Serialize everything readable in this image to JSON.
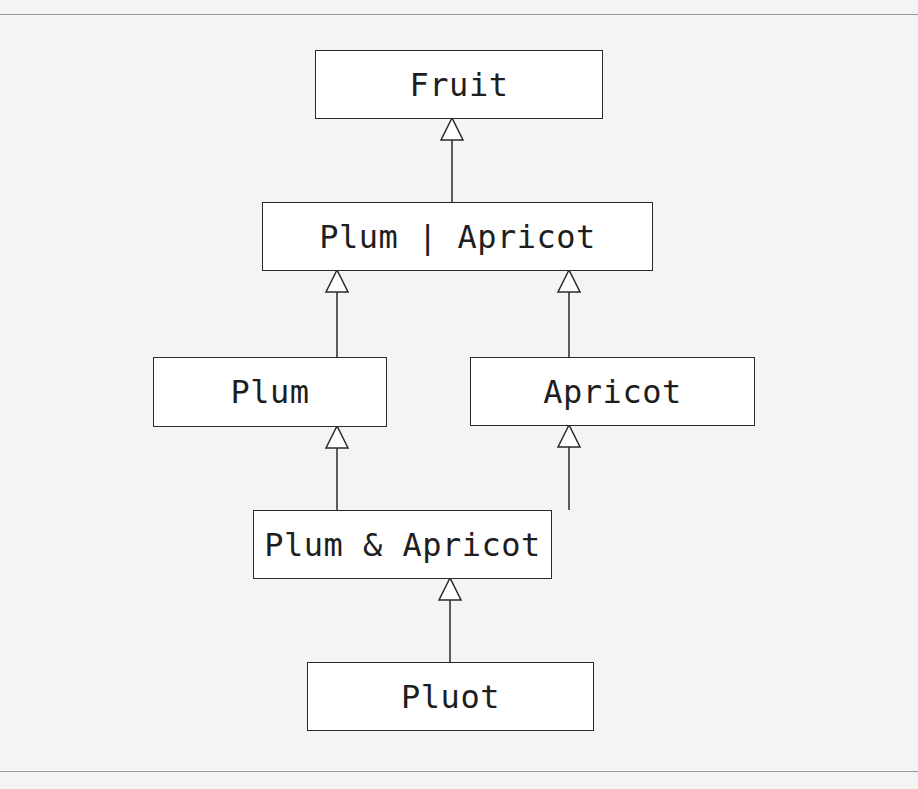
{
  "diagram": {
    "type": "class-hierarchy",
    "nodes": [
      {
        "id": "fruit",
        "label": "Fruit"
      },
      {
        "id": "plum_or_apricot",
        "label": "Plum | Apricot"
      },
      {
        "id": "plum",
        "label": "Plum"
      },
      {
        "id": "apricot",
        "label": "Apricot"
      },
      {
        "id": "plum_and_apricot",
        "label": "Plum & Apricot"
      },
      {
        "id": "pluot",
        "label": "Pluot"
      }
    ],
    "edges": [
      {
        "from": "plum_or_apricot",
        "to": "fruit",
        "kind": "inheritance"
      },
      {
        "from": "plum",
        "to": "plum_or_apricot",
        "kind": "inheritance"
      },
      {
        "from": "apricot",
        "to": "plum_or_apricot",
        "kind": "inheritance"
      },
      {
        "from": "plum_and_apricot",
        "to": "plum",
        "kind": "inheritance"
      },
      {
        "from": "plum_and_apricot",
        "to": "apricot",
        "kind": "inheritance"
      },
      {
        "from": "pluot",
        "to": "plum_and_apricot",
        "kind": "inheritance"
      }
    ]
  }
}
